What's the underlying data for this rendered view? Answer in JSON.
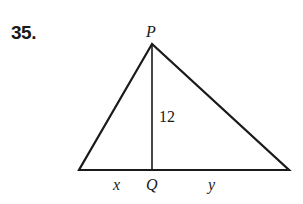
{
  "problem": {
    "number": "35."
  },
  "figure": {
    "vertex_top_label": "P",
    "foot_label": "Q",
    "altitude_label": "12",
    "left_segment_label": "x",
    "right_segment_label": "y"
  }
}
